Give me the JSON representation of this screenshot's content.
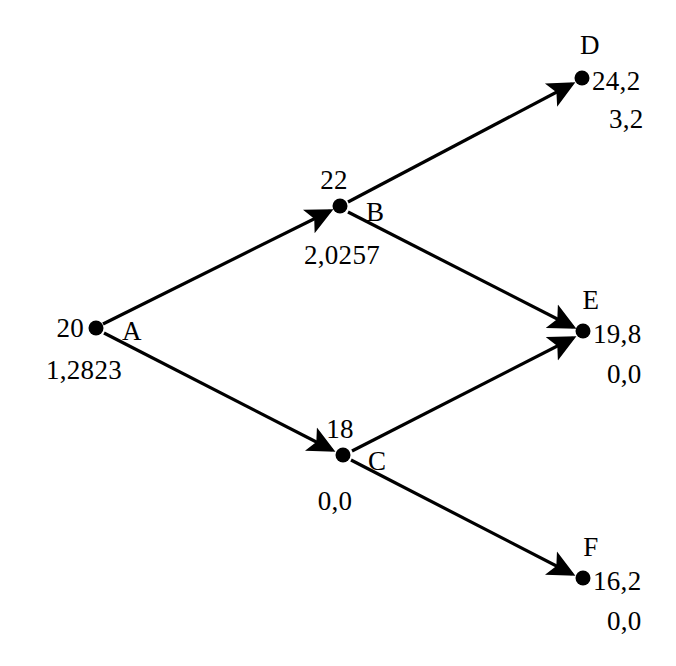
{
  "diagram": {
    "type": "directed-graph",
    "title": "",
    "background_color": "#ffffff",
    "stroke_color": "#000000",
    "canvas": {
      "width": 676,
      "height": 666
    },
    "nodes": [
      {
        "id": "A",
        "name": "A",
        "x": 96,
        "y": 328,
        "value": "20",
        "secondary": "1,2823",
        "id_label_pos": "right",
        "value_label_pos": "left",
        "secondary_label_pos": "below-left"
      },
      {
        "id": "B",
        "name": "B",
        "x": 340,
        "y": 206,
        "value": "22",
        "secondary": "2,0257",
        "id_label_pos": "right",
        "value_label_pos": "above",
        "secondary_label_pos": "below"
      },
      {
        "id": "C",
        "name": "C",
        "x": 343,
        "y": 455,
        "value": "18",
        "secondary": "0,0",
        "id_label_pos": "right",
        "value_label_pos": "above",
        "secondary_label_pos": "below"
      },
      {
        "id": "D",
        "name": "D",
        "x": 582,
        "y": 78,
        "value": "24,2",
        "secondary": "3,2",
        "id_label_pos": "above",
        "value_label_pos": "right",
        "secondary_label_pos": "below-right"
      },
      {
        "id": "E",
        "name": "E",
        "x": 583,
        "y": 331,
        "value": "19,8",
        "secondary": "0,0",
        "id_label_pos": "above",
        "value_label_pos": "right",
        "secondary_label_pos": "below-right"
      },
      {
        "id": "F",
        "name": "F",
        "x": 583,
        "y": 578,
        "value": "16,2",
        "secondary": "0,0",
        "id_label_pos": "above",
        "value_label_pos": "right",
        "secondary_label_pos": "below-right"
      }
    ],
    "edges": [
      {
        "from": "A",
        "to": "B",
        "directed": true
      },
      {
        "from": "A",
        "to": "C",
        "directed": true
      },
      {
        "from": "B",
        "to": "D",
        "directed": true
      },
      {
        "from": "B",
        "to": "E",
        "directed": true
      },
      {
        "from": "C",
        "to": "E",
        "directed": true
      },
      {
        "from": "C",
        "to": "F",
        "directed": true
      }
    ],
    "labels": {
      "node_A_id": "A",
      "node_A_value": "20",
      "node_A_secondary": "1,2823",
      "node_B_id": "B",
      "node_B_value": "22",
      "node_B_secondary": "2,0257",
      "node_C_id": "C",
      "node_C_value": "18",
      "node_C_secondary": "0,0",
      "node_D_id": "D",
      "node_D_value": "24,2",
      "node_D_secondary": "3,2",
      "node_E_id": "E",
      "node_E_value": "19,8",
      "node_E_secondary": "0,0",
      "node_F_id": "F",
      "node_F_value": "16,2",
      "node_F_secondary": "0,0"
    }
  }
}
